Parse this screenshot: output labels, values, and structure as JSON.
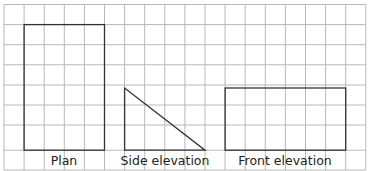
{
  "diagram": {
    "grid": {
      "x0": 4,
      "y0": 4.5,
      "cell": 20.1,
      "cols": 18,
      "rows": 8,
      "color": "#b8b8b8"
    },
    "shapes": [
      {
        "name": "plan",
        "type": "rect",
        "x1": 1,
        "y1": 1,
        "x2": 5,
        "y2": 7,
        "label": "Plan"
      },
      {
        "name": "side-elevation",
        "type": "right-triangle",
        "x1": 6,
        "y1": 4,
        "x2": 10,
        "y2": 7,
        "label": "Side elevation"
      },
      {
        "name": "front-elevation",
        "type": "rect",
        "x1": 11,
        "y1": 4,
        "x2": 17,
        "y2": 7,
        "label": "Front elevation"
      }
    ],
    "outline_color": "#333333"
  },
  "labels": {
    "plan": "Plan",
    "side": "Side elevation",
    "front": "Front elevation"
  }
}
